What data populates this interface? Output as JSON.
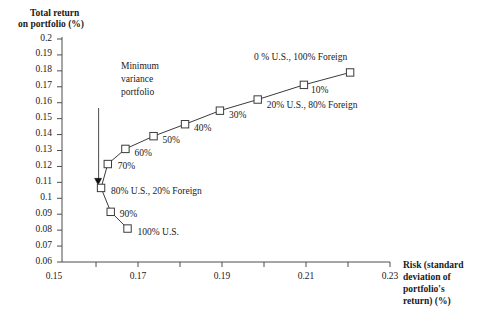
{
  "chart_data": {
    "type": "line",
    "title": "",
    "ylabel": "Total return on portfolio (%)",
    "xlabel": "Risk (standard deviation of portfolio's return) (%)",
    "xlim": [
      0.15,
      0.23
    ],
    "ylim": [
      0.06,
      0.2
    ],
    "grid": false,
    "legend": "none",
    "x_ticks": [
      "0.15",
      "0.17",
      "0.19",
      "0.21",
      "0.23"
    ],
    "x_tick_values": [
      0.15,
      0.17,
      0.19,
      0.21,
      0.23
    ],
    "x_minor_tick_values": [
      0.16,
      0.18,
      0.2,
      0.22
    ],
    "y_ticks": [
      "0.2",
      "0.19",
      "0.18",
      "0.17",
      "0.16",
      "0.15",
      "0.14",
      "0.13",
      "0.12",
      "0.11",
      "0.1",
      "0.09",
      "0.08",
      "0.07",
      "0.06"
    ],
    "y_tick_values": [
      0.2,
      0.19,
      0.18,
      0.17,
      0.16,
      0.15,
      0.14,
      0.13,
      0.12,
      0.11,
      0.1,
      0.09,
      0.08,
      0.07,
      0.06
    ],
    "marker": "open-square",
    "series": [
      {
        "name": "Efficient frontier (U.S. / Foreign mix)",
        "points": [
          {
            "label": "100% U.S.",
            "x": 0.1675,
            "y": 0.081,
            "label_dx": 10,
            "label_dy": 4
          },
          {
            "label": "90%",
            "x": 0.1635,
            "y": 0.0915,
            "label_dx": 9,
            "label_dy": 3
          },
          {
            "label": "80% U.S., 20% Foreign",
            "x": 0.1612,
            "y": 0.1065,
            "label_dx": 10,
            "label_dy": 4
          },
          {
            "label": "70%",
            "x": 0.1628,
            "y": 0.1215,
            "label_dx": 10,
            "label_dy": 3
          },
          {
            "label": "60%",
            "x": 0.167,
            "y": 0.131,
            "label_dx": 9,
            "label_dy": 5
          },
          {
            "label": "50%",
            "x": 0.1737,
            "y": 0.139,
            "label_dx": 9,
            "label_dy": 5
          },
          {
            "label": "40%",
            "x": 0.1812,
            "y": 0.1465,
            "label_dx": 9,
            "label_dy": 5
          },
          {
            "label": "30%",
            "x": 0.1895,
            "y": 0.155,
            "label_dx": 9,
            "label_dy": 5
          },
          {
            "label": "20% U.S., 80% Foreign",
            "x": 0.1985,
            "y": 0.162,
            "label_dx": 9,
            "label_dy": 6
          },
          {
            "label": "10%",
            "x": 0.2095,
            "y": 0.1712,
            "label_dx": 7,
            "label_dy": 6
          },
          {
            "label": "0 % U.S., 100% Foreign",
            "x": 0.2205,
            "y": 0.179,
            "label_dx": -96,
            "label_dy": -14
          }
        ]
      }
    ],
    "annotations": [
      {
        "name": "minimum-variance-portfolio",
        "text_lines": [
          "Minimum",
          "variance",
          "portfolio"
        ],
        "pointer_to": {
          "x": 0.1605,
          "y": 0.11
        },
        "marker": "filled-triangle"
      }
    ]
  },
  "axis_titles": {
    "y_line1": "Total return",
    "y_line2": "on portfolio (%)",
    "x_line1": "Risk (standard",
    "x_line2": "deviation of",
    "x_line3": "portfolio's",
    "x_line4": "return) (%)"
  },
  "colors": {
    "axis": "#4d4d4d",
    "line": "#3b3b3b",
    "marker_fill": "#ffffff",
    "marker_stroke": "#3b3b3b",
    "text": "#1a1a1a"
  }
}
